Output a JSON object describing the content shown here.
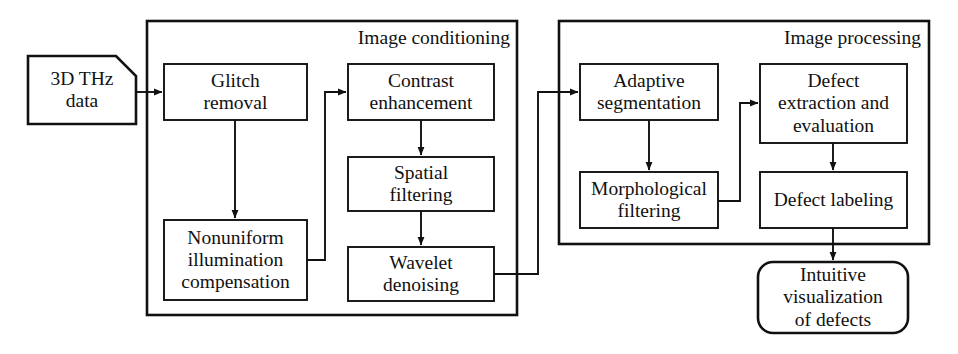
{
  "diagram": {
    "canvas": {
      "width": 958,
      "height": 354
    },
    "colors": {
      "stroke": "#111111",
      "background": "#ffffff",
      "text": "#111111"
    },
    "groups": [
      {
        "id": "image-conditioning",
        "label": "Image conditioning",
        "x": 146,
        "y": 20,
        "w": 372,
        "h": 296,
        "label_x": 330,
        "label_y": 27,
        "label_w": 180,
        "label_h": 26
      },
      {
        "id": "image-processing",
        "label": "Image processing",
        "x": 558,
        "y": 20,
        "w": 372,
        "h": 225,
        "label_x": 745,
        "label_y": 27,
        "label_w": 176,
        "label_h": 26
      }
    ],
    "nodes": [
      {
        "id": "thz-data",
        "label": "3D THz\ndata",
        "shape": "document",
        "x": 28,
        "y": 56,
        "w": 108,
        "h": 68
      },
      {
        "id": "glitch-removal",
        "label": "Glitch\nremoval",
        "shape": "rect",
        "x": 164,
        "y": 64,
        "w": 143,
        "h": 56
      },
      {
        "id": "nonuniform-illumination-compensation",
        "label": "Nonuniform\nillumination\ncompensation",
        "shape": "rect",
        "x": 164,
        "y": 220,
        "w": 143,
        "h": 80
      },
      {
        "id": "contrast-enhancement",
        "label": "Contrast\nenhancement",
        "shape": "rect",
        "x": 348,
        "y": 64,
        "w": 146,
        "h": 56
      },
      {
        "id": "spatial-filtering",
        "label": "Spatial\nfiltering",
        "shape": "rect",
        "x": 348,
        "y": 157,
        "w": 146,
        "h": 54
      },
      {
        "id": "wavelet-denoising",
        "label": "Wavelet\ndenoising",
        "shape": "rect",
        "x": 348,
        "y": 247,
        "w": 146,
        "h": 54
      },
      {
        "id": "adaptive-segmentation",
        "label": "Adaptive\nsegmentation",
        "shape": "rect",
        "x": 580,
        "y": 64,
        "w": 138,
        "h": 56
      },
      {
        "id": "morphological-filtering",
        "label": "Morphological\nfiltering",
        "shape": "rect",
        "x": 580,
        "y": 172,
        "w": 138,
        "h": 56
      },
      {
        "id": "defect-extraction-and-evaluation",
        "label": "Defect\nextraction and\nevaluation",
        "shape": "rect",
        "x": 760,
        "y": 64,
        "w": 147,
        "h": 79
      },
      {
        "id": "defect-labeling",
        "label": "Defect labeling",
        "shape": "rect",
        "x": 760,
        "y": 172,
        "w": 147,
        "h": 56
      },
      {
        "id": "intuitive-visualization-of-defects",
        "label": "Intuitive\nvisualization\nof defects",
        "shape": "rounded",
        "x": 758,
        "y": 262,
        "w": 150,
        "h": 71
      }
    ],
    "connectors": [
      {
        "id": "thz-data-to-glitch-removal",
        "from": "thz-data",
        "to": "glitch-removal",
        "path": "M 136 92 L 162 92",
        "arrow": true
      },
      {
        "id": "glitch-removal-to-nonuniform",
        "from": "glitch-removal",
        "to": "nonuniform-illumination-compensation",
        "path": "M 235 120 L 235 218",
        "arrow": true
      },
      {
        "id": "nonuniform-to-contrast",
        "from": "nonuniform-illumination-compensation",
        "to": "contrast-enhancement",
        "path": "M 307 260 L 325 260 L 325 92 L 346 92",
        "arrow": true
      },
      {
        "id": "contrast-to-spatial",
        "from": "contrast-enhancement",
        "to": "spatial-filtering",
        "path": "M 421 120 L 421 155",
        "arrow": true
      },
      {
        "id": "spatial-to-wavelet",
        "from": "spatial-filtering",
        "to": "wavelet-denoising",
        "path": "M 421 211 L 421 245",
        "arrow": true
      },
      {
        "id": "wavelet-to-adaptive",
        "from": "wavelet-denoising",
        "to": "adaptive-segmentation",
        "path": "M 494 274 L 538 274 L 538 92 L 578 92",
        "arrow": true
      },
      {
        "id": "adaptive-to-morphological",
        "from": "adaptive-segmentation",
        "to": "morphological-filtering",
        "path": "M 649 120 L 649 170",
        "arrow": true
      },
      {
        "id": "morphological-to-defect-extraction",
        "from": "morphological-filtering",
        "to": "defect-extraction-and-evaluation",
        "path": "M 718 201 L 740 201 L 740 103 L 758 103",
        "arrow": true
      },
      {
        "id": "defect-extraction-to-defect-labeling",
        "from": "defect-extraction-and-evaluation",
        "to": "defect-labeling",
        "path": "M 833 143 L 833 170",
        "arrow": true
      },
      {
        "id": "defect-labeling-to-intuitive-visualization",
        "from": "defect-labeling",
        "to": "intuitive-visualization-of-defects",
        "path": "M 833 228 L 833 260",
        "arrow": true
      }
    ]
  }
}
